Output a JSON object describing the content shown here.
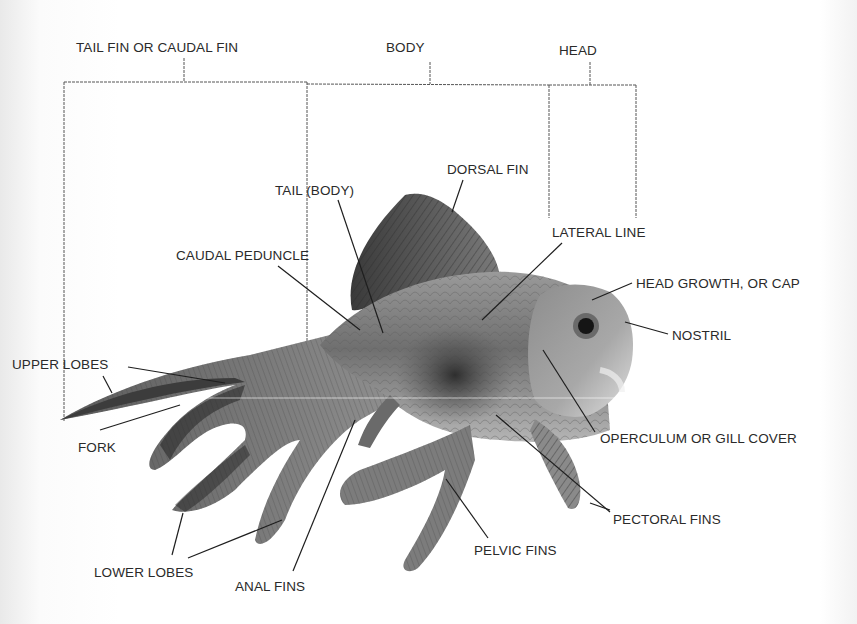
{
  "diagram": {
    "colors": {
      "background": "#ffffff",
      "label_text": "#2a2a2a",
      "leader_line": "#1e1e1e",
      "bracket_line": "#555555"
    },
    "region_labels": [
      {
        "id": "tail-fin",
        "text": "TAIL FIN OR CAUDAL FIN",
        "x": 76,
        "y": 41
      },
      {
        "id": "body",
        "text": "BODY",
        "x": 386,
        "y": 41
      },
      {
        "id": "head",
        "text": "HEAD",
        "x": 559,
        "y": 44
      }
    ],
    "part_labels": [
      {
        "id": "dorsal-fin",
        "text": "DORSAL FIN",
        "x": 447,
        "y": 163
      },
      {
        "id": "tail-body",
        "text": "TAIL (BODY)",
        "x": 275,
        "y": 184
      },
      {
        "id": "lateral-line",
        "text": "LATERAL LINE",
        "x": 552,
        "y": 226
      },
      {
        "id": "caudal-peduncle",
        "text": "CAUDAL PEDUNCLE",
        "x": 176,
        "y": 249
      },
      {
        "id": "head-growth",
        "text": "HEAD GROWTH, OR CAP",
        "x": 636,
        "y": 277
      },
      {
        "id": "nostril",
        "text": "NOSTRIL",
        "x": 672,
        "y": 329
      },
      {
        "id": "upper-lobes",
        "text": "UPPER LOBES",
        "x": 12,
        "y": 358
      },
      {
        "id": "fork",
        "text": "FORK",
        "x": 78,
        "y": 441
      },
      {
        "id": "operculum",
        "text": "OPERCULUM OR GILL COVER",
        "x": 600,
        "y": 432
      },
      {
        "id": "pectoral-fins",
        "text": "PECTORAL FINS",
        "x": 613,
        "y": 513
      },
      {
        "id": "pelvic-fins",
        "text": "PELVIC FINS",
        "x": 474,
        "y": 544
      },
      {
        "id": "lower-lobes",
        "text": "LOWER LOBES",
        "x": 94,
        "y": 566
      },
      {
        "id": "anal-fins",
        "text": "ANAL FINS",
        "x": 235,
        "y": 580
      }
    ]
  }
}
